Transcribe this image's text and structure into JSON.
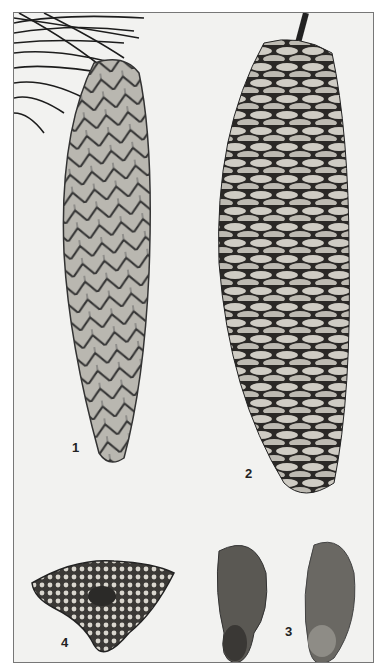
{
  "plate": {
    "figures": [
      {
        "id": "1",
        "label": "1",
        "subject": "closed pine cone with needles"
      },
      {
        "id": "2",
        "label": "2",
        "subject": "open pine cone with stem"
      },
      {
        "id": "3",
        "label": "3",
        "subject": "pair of winged seeds"
      },
      {
        "id": "4",
        "label": "4",
        "subject": "cone cross-section"
      }
    ],
    "colors": {
      "background": "#f2f2f0",
      "frame": "#777777",
      "ink": "#222222"
    }
  }
}
